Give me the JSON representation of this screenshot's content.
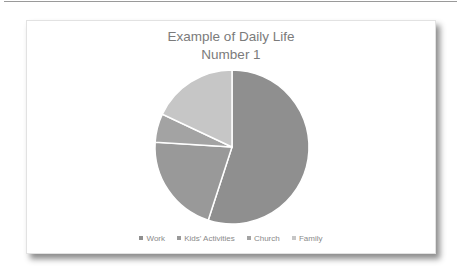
{
  "chart_data": {
    "type": "pie",
    "title": "Example of Daily Life Number 1",
    "title_lines": [
      "Example of Daily Life",
      "Number 1"
    ],
    "categories": [
      "Work",
      "Kids' Activities",
      "Church",
      "Family"
    ],
    "values": [
      55,
      21,
      6,
      18
    ],
    "unit": "percent (estimated)",
    "colors": [
      "#8f8f8f",
      "#999999",
      "#a3a3a3",
      "#c6c6c6"
    ],
    "start_angle": "12 o'clock, clockwise",
    "legend_position": "bottom"
  },
  "legend": [
    {
      "label": "Work",
      "color": "#8f8f8f"
    },
    {
      "label": "Kids' Activities",
      "color": "#999999"
    },
    {
      "label": "Church",
      "color": "#a3a3a3"
    },
    {
      "label": "Family",
      "color": "#c6c6c6"
    }
  ]
}
